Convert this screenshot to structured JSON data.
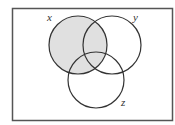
{
  "diagram": {
    "type": "venn",
    "sets": [
      {
        "name": "x",
        "label": "x",
        "cx": 78,
        "cy": 45,
        "r": 29,
        "shaded": true
      },
      {
        "name": "y",
        "label": "y",
        "cx": 112,
        "cy": 45,
        "r": 29,
        "shaded": false
      },
      {
        "name": "z",
        "label": "z",
        "cx": 96,
        "cy": 80,
        "r": 28,
        "shaded": false
      }
    ],
    "shaded_region": "x",
    "colors": {
      "shade": "#e0e0e0",
      "stroke": "#333333",
      "border": "#555555",
      "background": "#ffffff"
    }
  }
}
